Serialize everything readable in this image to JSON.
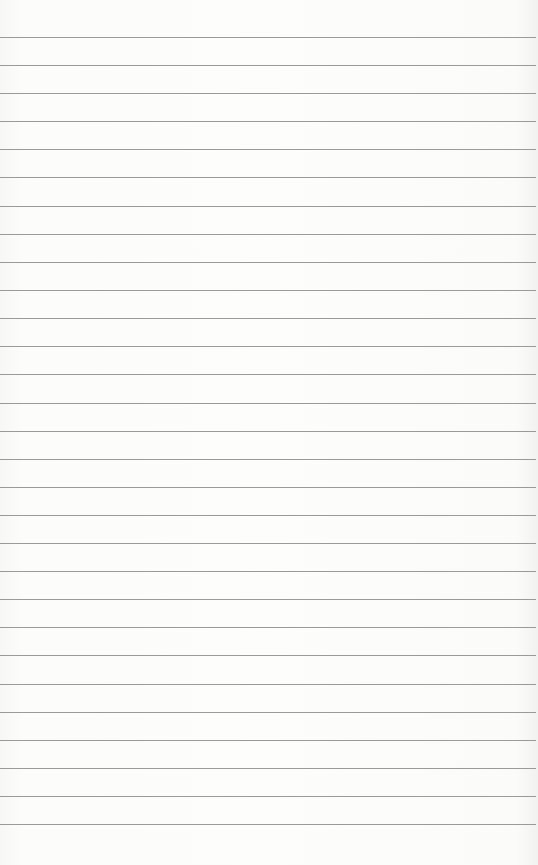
{
  "paper": {
    "background": "#fbfbfa",
    "rule_color": "#9a9a9a",
    "rule_positions": [
      37,
      65,
      93,
      121,
      149,
      177,
      206,
      234,
      262,
      290,
      318,
      346,
      374,
      403,
      431,
      459,
      487,
      515,
      543,
      571,
      599,
      627,
      655,
      684,
      712,
      740,
      768,
      796,
      824
    ]
  }
}
